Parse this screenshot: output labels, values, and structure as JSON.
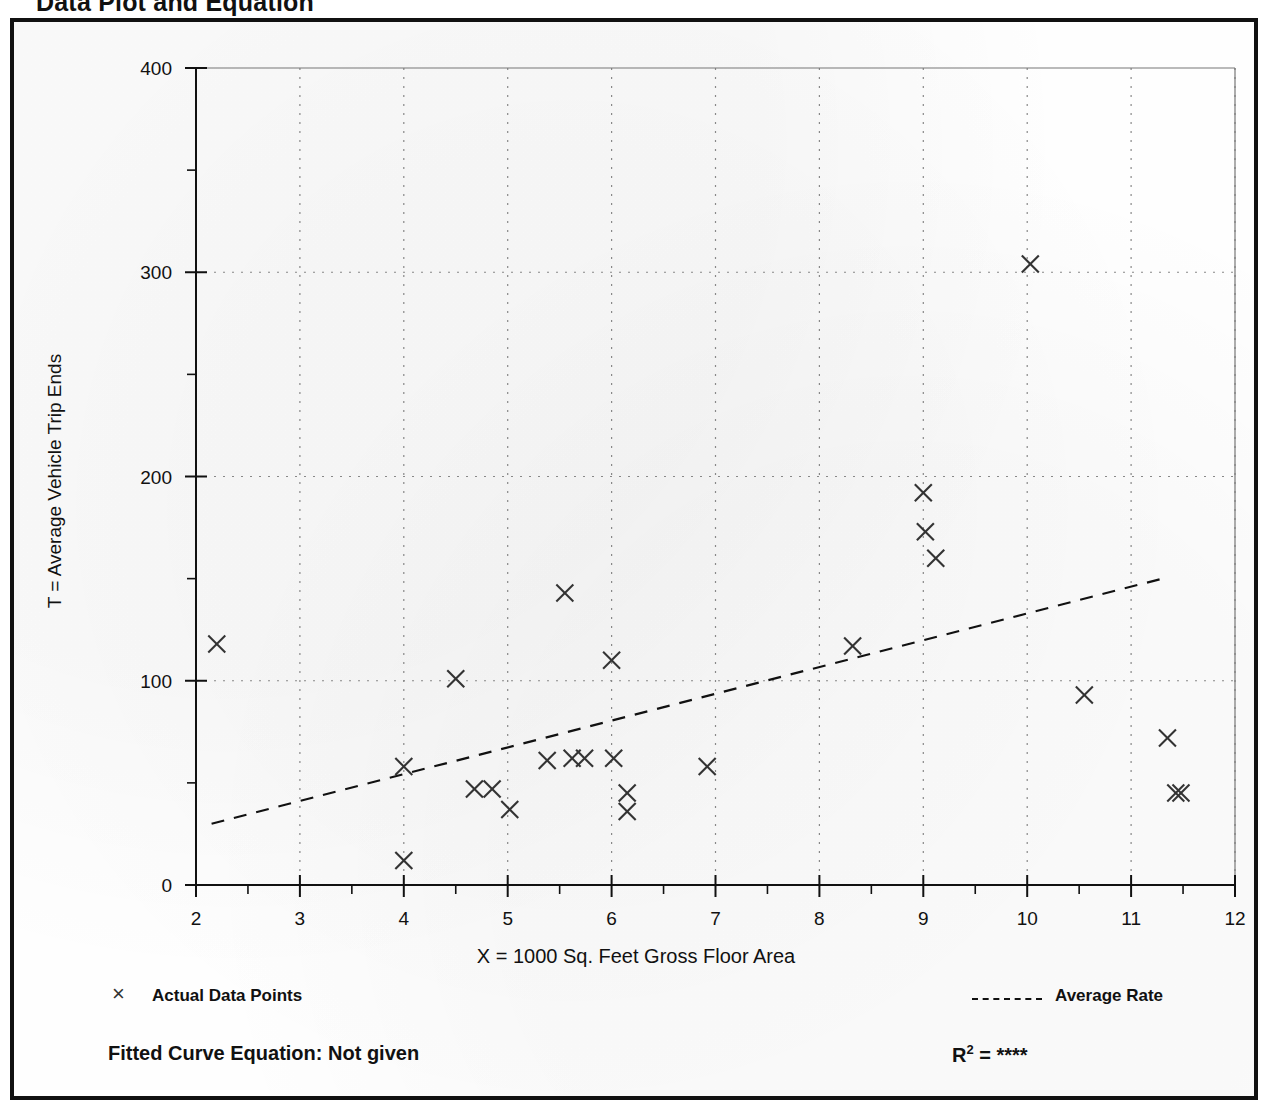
{
  "page": {
    "title": "Data Plot and Equation"
  },
  "axis_titles": {
    "x": "X = 1000 Sq. Feet Gross Floor Area",
    "y": "T = Average Vehicle Trip Ends"
  },
  "legend": {
    "points_label": "Actual Data Points",
    "points_marker": "×",
    "rate_label": "Average Rate"
  },
  "footer": {
    "fitted_equation": "Fitted Curve Equation:  Not given",
    "r2_prefix": "R",
    "r2_exponent": "2",
    "r2_value": "= ****"
  },
  "colors": {
    "ink": "#111111",
    "grid": "#888888",
    "marker": "#333333"
  },
  "chart_data": {
    "type": "scatter",
    "title": "Data Plot and Equation",
    "xlabel": "X = 1000 Sq. Feet Gross Floor Area",
    "ylabel": "T = Average Vehicle Trip Ends",
    "xlim": [
      2,
      12
    ],
    "ylim": [
      0,
      400
    ],
    "xticks": [
      2,
      3,
      4,
      5,
      6,
      7,
      8,
      9,
      10,
      11,
      12
    ],
    "yticks": [
      0,
      100,
      200,
      300,
      400
    ],
    "y_minor_ticks": [
      50,
      150,
      250,
      350
    ],
    "grid": "dotted vertical at each x integer; dotted horizontal at 100, 200, 300",
    "legend_position": "below plot, left = markers, right = line",
    "series": [
      {
        "name": "Actual Data Points",
        "marker": "x",
        "points": [
          [
            2.2,
            118
          ],
          [
            4.0,
            58
          ],
          [
            4.0,
            12
          ],
          [
            4.5,
            101
          ],
          [
            4.68,
            47
          ],
          [
            4.85,
            47
          ],
          [
            5.02,
            37
          ],
          [
            5.38,
            61
          ],
          [
            5.55,
            143
          ],
          [
            5.62,
            62
          ],
          [
            5.74,
            62
          ],
          [
            6.0,
            110
          ],
          [
            6.02,
            62
          ],
          [
            6.15,
            45
          ],
          [
            6.15,
            36
          ],
          [
            6.92,
            58
          ],
          [
            8.32,
            117
          ],
          [
            9.0,
            192
          ],
          [
            9.02,
            173
          ],
          [
            9.12,
            160
          ],
          [
            10.03,
            304
          ],
          [
            10.55,
            93
          ],
          [
            11.35,
            72
          ],
          [
            11.43,
            45
          ],
          [
            11.48,
            45
          ]
        ]
      },
      {
        "name": "Average Rate",
        "type": "line",
        "style": "dashed",
        "endpoints": [
          [
            2.15,
            30
          ],
          [
            11.3,
            150
          ]
        ]
      }
    ]
  }
}
